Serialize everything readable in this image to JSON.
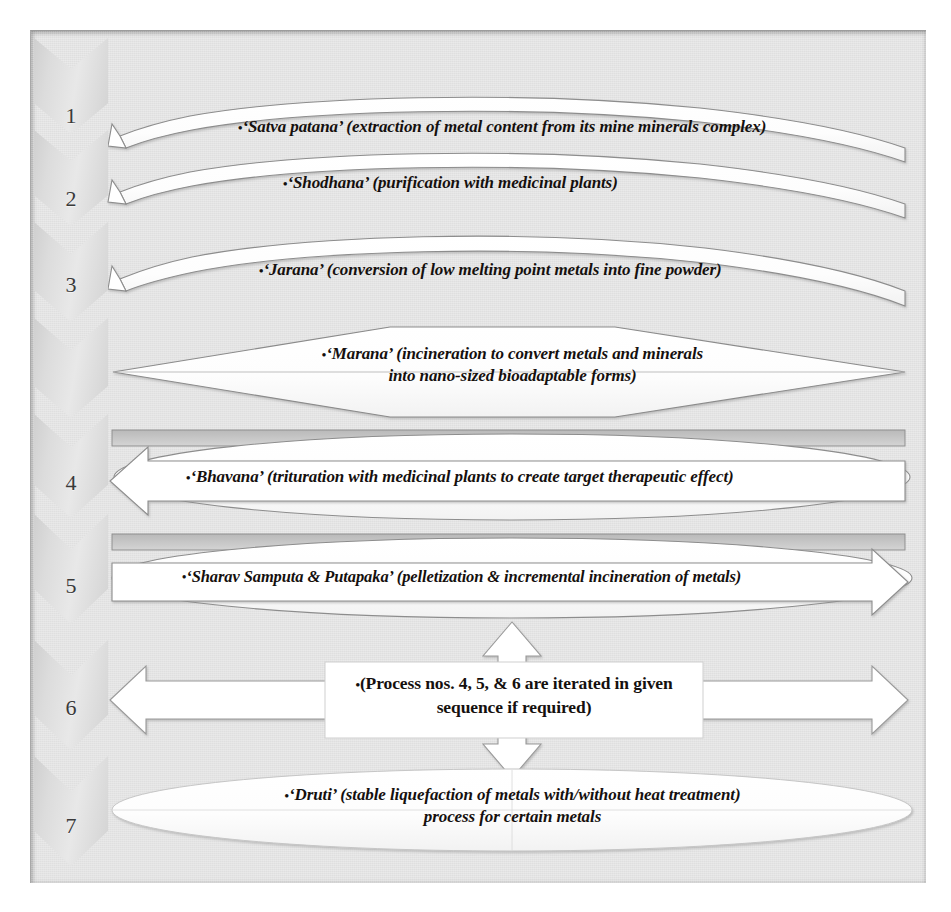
{
  "diagram": {
    "background_color": "#e3e3e3",
    "frame_color": "#9c9c9c",
    "shape_fill_white": "#ffffff",
    "shape_fill_gray": "#d2d2d2",
    "text_color": "#15100e",
    "steps": [
      {
        "number": "1",
        "shape": "curved-arrow",
        "bullet": "•",
        "text": "‘Satva patana’ (extraction of metal content from its mine minerals complex)"
      },
      {
        "number": "2",
        "shape": "curved-arrow",
        "bullet": "•",
        "text": "‘Shodhana’ (purification with medicinal plants)"
      },
      {
        "number": "3",
        "shape": "curved-arrow",
        "bullet": "•",
        "text": "‘Jarana’ (conversion of low melting point metals into fine powder)"
      },
      {
        "number": "",
        "shape": "hexagon-diamond",
        "bullet": "•",
        "text_line1": "‘Marana’ (incineration to convert metals and minerals",
        "text_line2": "into nano-sized bioadaptable forms)"
      },
      {
        "number": "4",
        "shape": "ellipse-with-left-arrow",
        "bullet": "•",
        "text": "‘Bhavana’ (trituration with medicinal plants to create target therapeutic effect)"
      },
      {
        "number": "5",
        "shape": "ellipse-with-right-arrow",
        "bullet": "•",
        "text": "‘Sharav Samputa & Putapaka’ (pelletization & incremental incineration of metals)"
      },
      {
        "number": "6",
        "shape": "box-with-four-arrows",
        "bullet": "•",
        "text_line1": "(Process nos. 4, 5, & 6 are iterated in given",
        "text_line2": "sequence if required)"
      },
      {
        "number": "7",
        "shape": "ellipse",
        "bullet": "•",
        "text_line1": "‘Druti’ (stable liquefaction of metals with/without heat treatment)",
        "text_line2": "process for certain metals"
      }
    ]
  }
}
